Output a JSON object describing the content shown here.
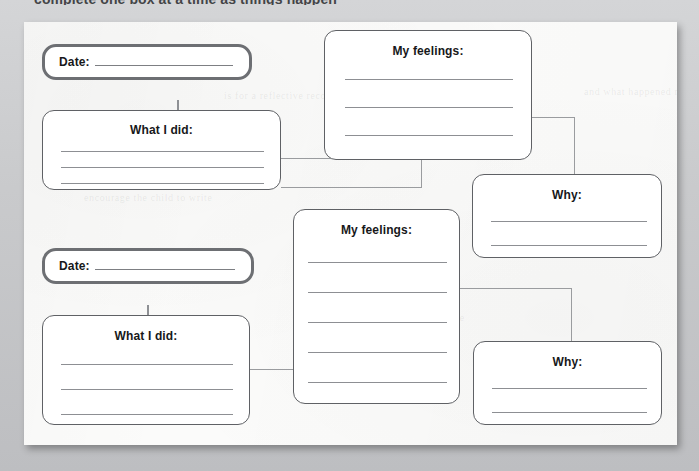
{
  "document": {
    "kind": "worksheet",
    "top_cropped_heading": "complete one box at a time as things happen",
    "ghost_lines": [
      "is for a reflective record of behaviour",
      "and what happened next",
      "encourage the child to write",
      "about how they felt at the time"
    ]
  },
  "colors": {
    "page": "#fbfbfa",
    "scan_background": "#c9cacc",
    "date_box_border": "#6d6f73",
    "plain_box_border": "#5f6165",
    "rule_line": "#8d8f93",
    "connector": "#8e9094",
    "text": "#17181a"
  },
  "boxes": {
    "date_1": {
      "label": "Date:",
      "value": ""
    },
    "what_i_did_1": {
      "title": "What I did:",
      "lines": 3
    },
    "my_feelings_1": {
      "title": "My feelings:",
      "lines": 3
    },
    "why_1": {
      "title": "Why:",
      "lines": 2
    },
    "date_2": {
      "label": "Date:",
      "value": ""
    },
    "what_i_did_2": {
      "title": "What I did:",
      "lines": 3
    },
    "my_feelings_2": {
      "title": "My feelings:",
      "lines": 5
    },
    "why_2": {
      "title": "Why:",
      "lines": 2
    }
  }
}
